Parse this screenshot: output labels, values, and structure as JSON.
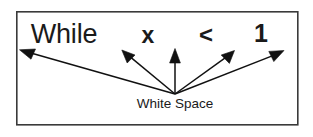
{
  "figure": {
    "name": "white-space-token-diagram",
    "caption": "White Space",
    "frame": {
      "x": 16,
      "y": 11,
      "width": 282,
      "height": 114,
      "stroke_color": "#3a3a3a",
      "fill_color": "#ffffff"
    },
    "origin": {
      "x": 175,
      "y": 94
    },
    "tokens": [
      {
        "id": "token-while",
        "label": "While",
        "x": 64,
        "y": 43
      },
      {
        "id": "token-x",
        "label": "x",
        "x": 148,
        "y": 43
      },
      {
        "id": "token-less-than",
        "label": "<",
        "x": 206,
        "y": 43
      },
      {
        "id": "token-one",
        "label": "1",
        "x": 261,
        "y": 42
      }
    ],
    "arrows": [
      {
        "id": "arrow-to-while",
        "from_x": 175,
        "from_y": 94,
        "to_x": 20,
        "to_y": 50
      },
      {
        "id": "arrow-to-x",
        "from_x": 175,
        "from_y": 94,
        "to_x": 122,
        "to_y": 50
      },
      {
        "id": "arrow-to-center",
        "from_x": 175,
        "from_y": 94,
        "to_x": 175,
        "to_y": 49
      },
      {
        "id": "arrow-to-less-than",
        "from_x": 175,
        "from_y": 94,
        "to_x": 234,
        "to_y": 50
      },
      {
        "id": "arrow-to-one",
        "from_x": 175,
        "from_y": 94,
        "to_x": 284,
        "to_y": 50
      }
    ],
    "caption_position": {
      "x": 175,
      "y": 108
    },
    "colors": {
      "ink": "#111111",
      "text": "#1a1a1a",
      "border": "#3a3a3a",
      "background": "#ffffff"
    }
  }
}
